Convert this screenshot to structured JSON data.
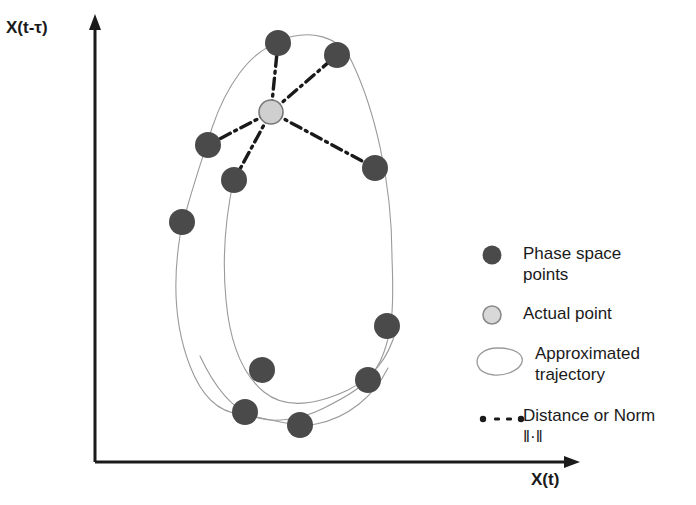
{
  "figure": {
    "title": "",
    "background": "#ffffff"
  },
  "axes": {
    "y_label": "X(t-τ)",
    "x_label": "X(t)",
    "color": "#1a1a1a",
    "origin": [
      95,
      462
    ],
    "y_top": [
      95,
      18
    ],
    "x_right": [
      580,
      462
    ]
  },
  "legend": {
    "items": [
      {
        "marker": "filled-dark-circle",
        "label": "Phase space\npoints",
        "color": "#4a4a4a"
      },
      {
        "marker": "light-gray-circle",
        "label": "Actual point",
        "color": "#cfcfcf"
      },
      {
        "marker": "thin-loop-curve",
        "label": "Approximated\ntrajectory",
        "color": "#9a9a9a"
      },
      {
        "marker": "dash-dot-line",
        "label": "Distance or Norm\n‖·‖",
        "color": "#1a1a1a"
      }
    ]
  },
  "chart_data": {
    "type": "scatter",
    "title": "",
    "xlabel": "X(t)",
    "ylabel": "X(t-τ)",
    "grid": false,
    "legend_position": "right",
    "colors": {
      "phase_point": "#4a4a4a",
      "actual_point": "#cfcfcf",
      "actual_point_edge": "#777777",
      "trajectory": "#9a9a9a",
      "distance_line": "#1a1a1a",
      "axis": "#1a1a1a"
    },
    "series": [
      {
        "name": "Phase space points",
        "marker": "filled-circle",
        "radius": 13,
        "points": [
          [
            278,
            43
          ],
          [
            337,
            55
          ],
          [
            208,
            145
          ],
          [
            234,
            180
          ],
          [
            375,
            168
          ],
          [
            182,
            222
          ],
          [
            387,
            326
          ],
          [
            262,
            370
          ],
          [
            368,
            380
          ],
          [
            245,
            412
          ],
          [
            300,
            425
          ]
        ]
      },
      {
        "name": "Actual point",
        "marker": "open-circle",
        "radius": 12,
        "points": [
          [
            271,
            112
          ]
        ]
      }
    ],
    "distance_lines": [
      {
        "from": [
          271,
          112
        ],
        "to": [
          278,
          43
        ]
      },
      {
        "from": [
          271,
          112
        ],
        "to": [
          337,
          55
        ]
      },
      {
        "from": [
          271,
          112
        ],
        "to": [
          208,
          145
        ]
      },
      {
        "from": [
          271,
          112
        ],
        "to": [
          234,
          180
        ]
      },
      {
        "from": [
          271,
          112
        ],
        "to": [
          375,
          168
        ]
      }
    ],
    "trajectory": {
      "name": "Approximated trajectory",
      "paths": [
        "M 278 41 C 310 28 340 36 352 62 C 374 108 392 180 392 258 C 394 308 392 330 384 352 C 374 382 352 394 324 408 C 300 420 272 424 252 416 C 232 408 214 386 200 356",
        "M 276 44 C 250 52 226 86 212 128 C 198 172 186 206 180 236 C 172 286 176 330 190 366 C 200 392 216 412 240 414 C 268 418 296 428 316 424 C 348 418 374 396 388 368",
        "M 234 178 C 226 214 222 258 226 300 C 230 344 242 374 264 392 C 286 410 318 404 348 390 C 372 378 388 360 396 330"
      ]
    }
  }
}
